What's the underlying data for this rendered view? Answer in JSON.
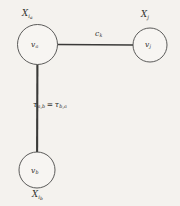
{
  "figure": {
    "type": "graph-diagram",
    "background_color": "#f4f2ee",
    "stroke_color": "#3a3a38",
    "text_color": "#2e2e2c",
    "nodes": [
      {
        "id": "va",
        "inner_label": "v",
        "inner_sub": "a",
        "variable_label": "X",
        "variable_sub": "i",
        "variable_subsub": "a",
        "variable_position": "above",
        "cx": 37.5,
        "cy": 44.5,
        "r": 20
      },
      {
        "id": "vj",
        "inner_label": "v",
        "inner_sub": "j",
        "variable_label": "X",
        "variable_sub": "j",
        "variable_subsub": "",
        "variable_position": "above",
        "cx": 150,
        "cy": 45,
        "r": 17
      },
      {
        "id": "vb",
        "inner_label": "v",
        "inner_sub": "b",
        "variable_label": "X",
        "variable_sub": "i",
        "variable_subsub": "b",
        "variable_position": "below",
        "cx": 37,
        "cy": 170,
        "r": 18
      }
    ],
    "edges": [
      {
        "id": "edge-va-vj",
        "from": "va",
        "to": "vj",
        "orientation": "horizontal",
        "label": "c",
        "label_sub": "k",
        "x1": 57.5,
        "y1": 44.5,
        "x2": 133,
        "y2": 45
      },
      {
        "id": "edge-va-vb",
        "from": "va",
        "to": "vb",
        "orientation": "vertical",
        "label_left": "τ",
        "label_left_sub": "a,b",
        "label_equals": "=",
        "label_right": "τ",
        "label_right_sub": "b,a",
        "x1": 37.5,
        "y1": 64.5,
        "x2": 37,
        "y2": 152
      }
    ]
  }
}
